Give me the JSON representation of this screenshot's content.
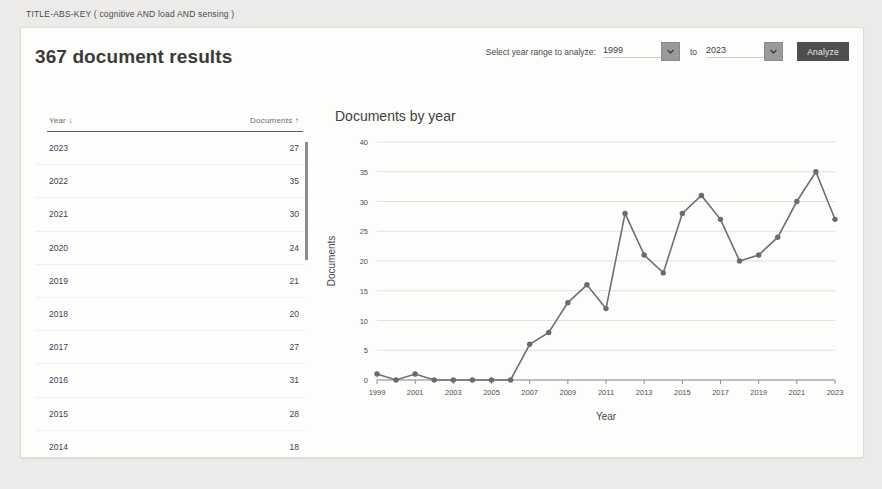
{
  "query": "TITLE-ABS-KEY ( cognitive  AND load  AND sensing )",
  "header": {
    "results_title": "367 document results",
    "range_label": "Select year range to analyze:",
    "year_from": "1999",
    "to_label": "to",
    "year_to": "2023",
    "analyze_label": "Analyze",
    "chevron_icon": "chevron-down-icon",
    "button_color": "#4f4f4f"
  },
  "table": {
    "col_year": "Year",
    "col_year_sort": "↓",
    "col_documents": "Documents",
    "col_documents_sort": "↑",
    "rows": [
      {
        "year": "2023",
        "documents": "27"
      },
      {
        "year": "2022",
        "documents": "35"
      },
      {
        "year": "2021",
        "documents": "30"
      },
      {
        "year": "2020",
        "documents": "24"
      },
      {
        "year": "2019",
        "documents": "21"
      },
      {
        "year": "2018",
        "documents": "20"
      },
      {
        "year": "2017",
        "documents": "27"
      },
      {
        "year": "2016",
        "documents": "31"
      },
      {
        "year": "2015",
        "documents": "28"
      },
      {
        "year": "2014",
        "documents": "18"
      }
    ]
  },
  "chart_data": {
    "type": "line",
    "title": "Documents by year",
    "xlabel": "Year",
    "ylabel": "Documents",
    "x": [
      1999,
      2000,
      2001,
      2002,
      2003,
      2004,
      2005,
      2006,
      2007,
      2008,
      2009,
      2010,
      2011,
      2012,
      2013,
      2014,
      2015,
      2016,
      2017,
      2018,
      2019,
      2020,
      2021,
      2022,
      2023
    ],
    "values": [
      1,
      0,
      1,
      0,
      0,
      0,
      0,
      0,
      6,
      8,
      13,
      16,
      12,
      28,
      21,
      18,
      28,
      31,
      27,
      20,
      21,
      24,
      30,
      35,
      27
    ],
    "xtick_labels": [
      "1999",
      "2001",
      "2003",
      "2005",
      "2007",
      "2009",
      "2011",
      "2013",
      "2015",
      "2017",
      "2019",
      "2021",
      "2023"
    ],
    "ytick_labels": [
      "0",
      "5",
      "10",
      "15",
      "20",
      "25",
      "30",
      "35",
      "40"
    ],
    "ylim": [
      0,
      40
    ],
    "xlim": [
      1999,
      2023
    ],
    "grid": true,
    "legend": "none",
    "line_color": "#6f6f6f",
    "marker_color": "#6b6b6b"
  }
}
